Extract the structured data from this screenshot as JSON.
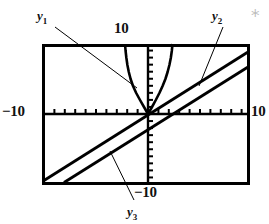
{
  "figure": {
    "kind": "graphing-calculator-viewing-window",
    "frame": {
      "stroke": "#000000",
      "stroke_width": 3,
      "x": 42,
      "y": 44,
      "width": 208,
      "height": 141
    },
    "axes": {
      "x_axis_y": 114,
      "y_axis_x": 148,
      "tick_len": 5,
      "x_tick_spacing": 10.4,
      "y_tick_spacing": 7.05,
      "stroke": "#000000",
      "stroke_width": 2
    },
    "labels": {
      "top": "10",
      "left": "−10",
      "right": "10",
      "bottom": "−10"
    },
    "curve_labels": [
      {
        "id": "y1",
        "base": "y",
        "sub": "1",
        "x": 37,
        "y": 9
      },
      {
        "id": "y2",
        "base": "y",
        "sub": "2",
        "x": 212,
        "y": 9
      },
      {
        "id": "y3",
        "base": "y",
        "sub": "3",
        "x": 127,
        "y": 205
      }
    ],
    "leader_lines": [
      {
        "for": "y1",
        "x1": 54,
        "y1": 26,
        "x2": 137,
        "y2": 88
      },
      {
        "for": "y2",
        "x1": 224,
        "y1": 26,
        "x2": 199,
        "y2": 86
      },
      {
        "for": "y3",
        "x1": 133,
        "y1": 200,
        "x2": 110,
        "y2": 152
      }
    ]
  },
  "chart_data": {
    "type": "line",
    "title": "",
    "xlabel": "",
    "ylabel": "",
    "xlim": [
      -10,
      10
    ],
    "ylim": [
      -10,
      10
    ],
    "grid": false,
    "legend": "inline-labels",
    "axis_tick_labels": {
      "xmin": "−10",
      "xmax": "10",
      "ymax": "10",
      "ymin": "−10"
    },
    "series": [
      {
        "name": "y1",
        "style": "steep-decreasing-curve",
        "note": "steep curve falling from upper-left through origin region",
        "points_px": [
          [
            125,
            44
          ],
          [
            126,
            50
          ],
          [
            127,
            57
          ],
          [
            128,
            64
          ],
          [
            129,
            71
          ],
          [
            131,
            79
          ],
          [
            133,
            86
          ],
          [
            136,
            93
          ],
          [
            140,
            100
          ],
          [
            144,
            107
          ],
          [
            148,
            114
          ]
        ]
      },
      {
        "name": "y2-steep",
        "style": "steep-increasing-curve",
        "note": "steep curve rising from origin region to top-right of window",
        "points_px": [
          [
            148,
            114
          ],
          [
            152,
            107
          ],
          [
            156,
            100
          ],
          [
            160,
            93
          ],
          [
            163,
            86
          ],
          [
            166,
            78
          ],
          [
            168,
            71
          ],
          [
            170,
            64
          ],
          [
            171,
            57
          ],
          [
            172,
            50
          ],
          [
            173,
            44
          ]
        ]
      },
      {
        "name": "y2-line",
        "style": "straight-line-upper",
        "note": "upper of two parallel straight lines, passes near origin",
        "points_px": [
          [
            42,
            180
          ],
          [
            148,
            114
          ],
          [
            250,
            50
          ]
        ]
      },
      {
        "name": "y3",
        "style": "straight-line-lower",
        "note": "lower parallel straight line, shifted right/down from y2 line",
        "points_px": [
          [
            63,
            185
          ],
          [
            170,
            118
          ],
          [
            250,
            68
          ]
        ]
      }
    ]
  }
}
